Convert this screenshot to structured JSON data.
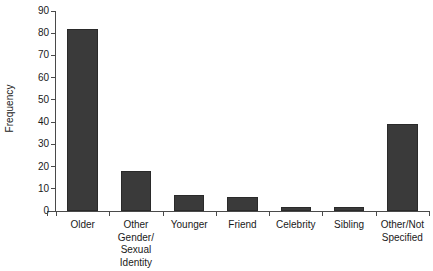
{
  "chart_data": {
    "type": "bar",
    "title": "",
    "subtitle": "",
    "xlabel": "",
    "ylabel": "Frequency",
    "categories": [
      "Older",
      "Other Gender/ Sexual Identity",
      "Younger",
      "Friend",
      "Celebrity",
      "Sibling",
      "Other/Not Specified"
    ],
    "category_lines": [
      [
        "Older"
      ],
      [
        "Other",
        "Gender/",
        "Sexual",
        "Identity"
      ],
      [
        "Younger"
      ],
      [
        "Friend"
      ],
      [
        "Celebrity"
      ],
      [
        "Sibling"
      ],
      [
        "Other/Not",
        "Specified"
      ]
    ],
    "values": [
      82,
      18,
      7,
      6.5,
      2,
      2,
      39
    ],
    "ylim": [
      0,
      90
    ],
    "yticks": [
      0,
      10,
      20,
      30,
      40,
      50,
      60,
      70,
      80,
      90
    ],
    "ytick_labels": [
      "0",
      "10",
      "20",
      "30",
      "40",
      "50",
      "60",
      "70",
      "80",
      "90"
    ],
    "grid": false,
    "legend": null,
    "bar_color": "#3a3a3a",
    "axis_color": "#4a4a4a",
    "background": "#ffffff"
  }
}
